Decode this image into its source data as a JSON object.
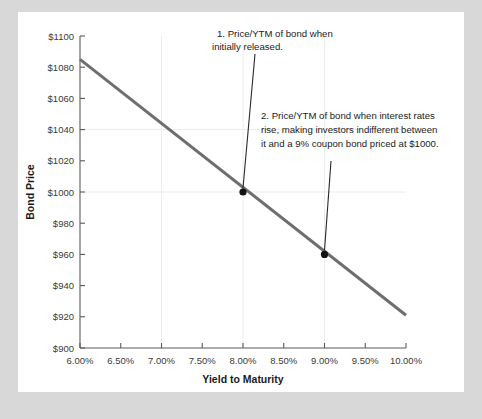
{
  "figure": {
    "background_color": "#d8d8d8",
    "card_color": "#ffffff"
  },
  "chart_data": {
    "type": "line",
    "title": "",
    "xlabel": "Yield to Maturity",
    "ylabel": "Bond Price",
    "xlim": [
      6.0,
      10.0
    ],
    "ylim": [
      900,
      1100
    ],
    "grid": true,
    "legend": "none",
    "line_color": "#6e6e6e",
    "x_tick_labels": [
      "6.00%",
      "6.50%",
      "7.00%",
      "7.50%",
      "8.00%",
      "8.50%",
      "9.00%",
      "9.50%",
      "10.00%"
    ],
    "x_tick_values": [
      6.0,
      6.5,
      7.0,
      7.5,
      8.0,
      8.5,
      9.0,
      9.5,
      10.0
    ],
    "y_tick_labels": [
      "$900",
      "$920",
      "$940",
      "$960",
      "$980",
      "$1000",
      "$1020",
      "$1040",
      "$1060",
      "$1080",
      "$1100"
    ],
    "y_tick_values": [
      900,
      920,
      940,
      960,
      980,
      1000,
      1020,
      1040,
      1060,
      1080,
      1100
    ],
    "series": [
      {
        "name": "Bond price vs yield to maturity",
        "x": [
          6.0,
          10.0
        ],
        "values": [
          1085,
          921
        ]
      }
    ],
    "points": [
      {
        "label": "Price/YTM of bond when initially released",
        "x": 8.0,
        "y": 1000
      },
      {
        "label": "Price/YTM of bond after interest rates rise",
        "x": 9.0,
        "y": 960
      }
    ],
    "annotations": [
      {
        "id": "annotation-1",
        "lines": [
          "1. Price/YTM of bond when",
          "initially released."
        ],
        "target_x": 8.0,
        "target_y": 1000
      },
      {
        "id": "annotation-2",
        "lines": [
          "2. Price/YTM of bond when interest rates",
          "rise, making investors indifferent between",
          "it and a 9% coupon bond priced at $1000."
        ],
        "target_x": 9.0,
        "target_y": 960
      }
    ]
  }
}
